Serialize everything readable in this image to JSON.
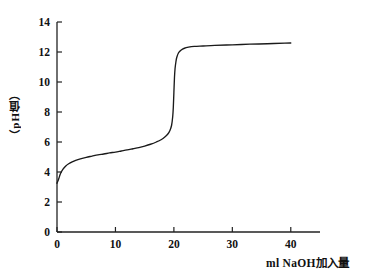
{
  "chart_data": {
    "type": "line",
    "title": "",
    "subtitle": "",
    "xlabel": "ml  NaOH加入量",
    "ylabel": "（pH值）",
    "xlim": [
      0,
      45
    ],
    "ylim": [
      0,
      14
    ],
    "grid": false,
    "legend": null,
    "xticks": [
      0,
      10,
      20,
      30,
      40
    ],
    "xtick_labels": [
      "0",
      "10",
      "20",
      "30",
      "40"
    ],
    "yticks": [
      0,
      2,
      4,
      6,
      8,
      10,
      12,
      14
    ],
    "ytick_labels": [
      "0",
      "2",
      "4",
      "6",
      "8",
      "10",
      "12",
      "14"
    ],
    "series": [
      {
        "name": "titration-curve",
        "color": "#1a1a1a",
        "x": [
          0.0,
          0.3,
          0.6,
          1.0,
          1.5,
          2.0,
          2.6,
          3.2,
          4.0,
          5.0,
          6.0,
          7.0,
          8.0,
          9.0,
          10.0,
          11.0,
          12.0,
          13.0,
          14.0,
          15.0,
          16.0,
          17.0,
          17.8,
          18.5,
          19.0,
          19.3,
          19.6,
          19.8,
          19.9,
          20.0,
          20.1,
          20.2,
          20.35,
          20.5,
          20.8,
          21.2,
          21.8,
          22.5,
          23.5,
          25.0,
          27.0,
          30.0,
          33.0,
          36.0,
          39.0,
          40.0
        ],
        "y": [
          3.25,
          3.55,
          3.9,
          4.18,
          4.4,
          4.55,
          4.68,
          4.78,
          4.88,
          4.98,
          5.06,
          5.14,
          5.2,
          5.27,
          5.33,
          5.4,
          5.47,
          5.55,
          5.63,
          5.73,
          5.85,
          6.0,
          6.15,
          6.35,
          6.55,
          6.75,
          7.1,
          7.7,
          8.3,
          9.3,
          10.3,
          10.9,
          11.35,
          11.65,
          11.95,
          12.12,
          12.25,
          12.32,
          12.37,
          12.4,
          12.44,
          12.48,
          12.52,
          12.55,
          12.59,
          12.6
        ]
      }
    ],
    "annotations": []
  },
  "axes": {
    "x_axis_name": "x-axis",
    "y_axis_name": "y-axis"
  }
}
